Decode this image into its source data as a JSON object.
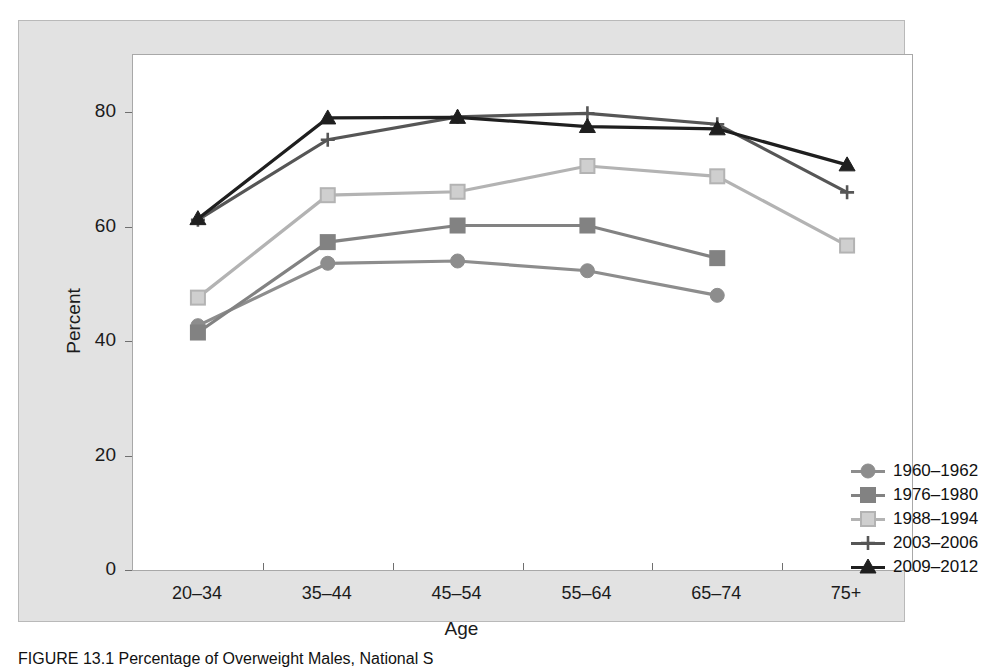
{
  "figure": {
    "caption": "FIGURE 13.1 Percentage of Overweight Males, National S"
  },
  "chart_data": {
    "type": "line",
    "title": "",
    "xlabel": "Age",
    "ylabel": "Percent",
    "categories": [
      "20–34",
      "35–44",
      "45–54",
      "55–64",
      "65–74",
      "75+"
    ],
    "ylim": [
      0,
      90
    ],
    "yticks": [
      0,
      20,
      40,
      60,
      80
    ],
    "ytick_labels": [
      "0",
      "20",
      "40",
      "60",
      "80"
    ],
    "grid": false,
    "legend_position": "inside-bottom-right",
    "series": [
      {
        "name": "1960–1962",
        "marker": "circle",
        "color": "#8d8d8d",
        "values": [
          42.7,
          53.6,
          54.0,
          52.3,
          48.0,
          null
        ]
      },
      {
        "name": "1976–1980",
        "marker": "square",
        "color": "#828282",
        "values": [
          41.5,
          57.3,
          60.2,
          60.2,
          54.5,
          null
        ]
      },
      {
        "name": "1988–1994",
        "marker": "square",
        "color": "#b3b3b3",
        "values": [
          47.6,
          65.5,
          66.1,
          70.6,
          68.8,
          56.7
        ]
      },
      {
        "name": "2003–2006",
        "marker": "plus",
        "color": "#565656",
        "values": [
          61.2,
          75.2,
          79.2,
          79.8,
          77.9,
          66.0
        ]
      },
      {
        "name": "2009–2012",
        "marker": "triangle",
        "color": "#1f1f1f",
        "values": [
          61.4,
          79.0,
          79.1,
          77.5,
          77.1,
          70.8
        ]
      }
    ]
  },
  "colors": {
    "panel_background": "#e2e2e2",
    "plot_background": "#ffffff",
    "axis": "#6f6f6f",
    "text": "#1b1b1b"
  }
}
